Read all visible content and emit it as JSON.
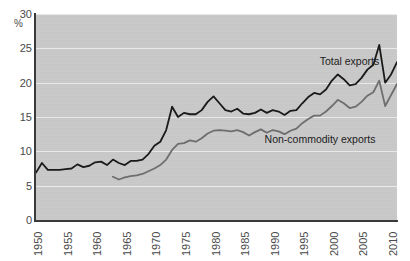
{
  "chart_data": {
    "type": "line",
    "title": "",
    "subtitle": "",
    "xlabel": "",
    "ylabel": "%",
    "ylim": [
      0,
      30
    ],
    "xlim": [
      1950,
      2011
    ],
    "yticks": [
      30,
      25,
      20,
      15,
      10,
      5,
      0
    ],
    "xticks": [
      1950,
      1955,
      1960,
      1965,
      1970,
      1975,
      1980,
      1985,
      1990,
      1995,
      2000,
      2005,
      2010
    ],
    "grid": "horizontal",
    "legend_position": "inline-annotations",
    "plot_background": "#c9c9c9",
    "gridline_color": "#efefef",
    "axis_color": "#3a3a3a",
    "series": [
      {
        "name": "Total exports",
        "color": "#1a1a1a",
        "label_x": 2003,
        "label_y": 23.2,
        "x": [
          1950,
          1951,
          1952,
          1953,
          1954,
          1955,
          1956,
          1957,
          1958,
          1959,
          1960,
          1961,
          1962,
          1963,
          1964,
          1965,
          1966,
          1967,
          1968,
          1969,
          1970,
          1971,
          1972,
          1973,
          1974,
          1975,
          1976,
          1977,
          1978,
          1979,
          1980,
          1981,
          1982,
          1983,
          1984,
          1985,
          1986,
          1987,
          1988,
          1989,
          1990,
          1991,
          1992,
          1993,
          1994,
          1995,
          1996,
          1997,
          1998,
          1999,
          2000,
          2001,
          2002,
          2003,
          2004,
          2005,
          2006,
          2007,
          2008,
          2009,
          2010,
          2011
        ],
        "y": [
          6.9,
          8.3,
          7.3,
          7.3,
          7.3,
          7.4,
          7.5,
          8.1,
          7.7,
          7.9,
          8.4,
          8.5,
          8.0,
          8.8,
          8.3,
          8.0,
          8.6,
          8.6,
          8.8,
          9.6,
          10.8,
          11.4,
          13.1,
          16.5,
          15.0,
          15.6,
          15.4,
          15.4,
          16.0,
          17.2,
          18.0,
          17.0,
          16.0,
          15.8,
          16.2,
          15.5,
          15.4,
          15.6,
          16.1,
          15.6,
          16.0,
          15.8,
          15.3,
          15.9,
          16.0,
          17.0,
          17.9,
          18.5,
          18.3,
          19.0,
          20.3,
          21.2,
          20.5,
          19.6,
          19.8,
          20.7,
          21.9,
          22.6,
          25.5,
          20.0,
          21.2,
          23.0
        ]
      },
      {
        "name": "Non-commodity exports",
        "color": "#6e6e6e",
        "label_x": 1998,
        "label_y": 11.8,
        "x": [
          1963,
          1964,
          1965,
          1966,
          1967,
          1968,
          1969,
          1970,
          1971,
          1972,
          1973,
          1974,
          1975,
          1976,
          1977,
          1978,
          1979,
          1980,
          1981,
          1982,
          1983,
          1984,
          1985,
          1986,
          1987,
          1988,
          1989,
          1990,
          1991,
          1992,
          1993,
          1994,
          1995,
          1996,
          1997,
          1998,
          1999,
          2000,
          2001,
          2002,
          2003,
          2004,
          2005,
          2006,
          2007,
          2008,
          2009,
          2010,
          2011
        ],
        "y": [
          6.3,
          5.9,
          6.2,
          6.4,
          6.5,
          6.7,
          7.1,
          7.5,
          8.0,
          8.8,
          10.2,
          11.1,
          11.2,
          11.6,
          11.4,
          11.9,
          12.6,
          13.0,
          13.1,
          13.0,
          12.9,
          13.1,
          12.8,
          12.3,
          12.8,
          13.2,
          12.7,
          13.1,
          12.9,
          12.5,
          13.0,
          13.3,
          14.1,
          14.7,
          15.2,
          15.2,
          15.8,
          16.6,
          17.5,
          17.0,
          16.3,
          16.5,
          17.2,
          18.1,
          18.6,
          20.3,
          16.6,
          18.2,
          19.8
        ]
      }
    ]
  },
  "axis": {
    "percent_symbol": "%"
  }
}
